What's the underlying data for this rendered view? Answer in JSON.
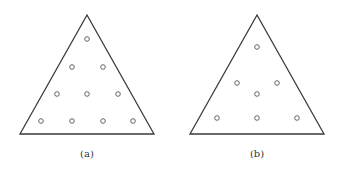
{
  "figure": {
    "panels": [
      {
        "id": "a",
        "caption": "(a)",
        "triangle": [
          [
            87,
            15
          ],
          [
            20,
            134
          ],
          [
            154,
            134
          ]
        ],
        "points": [
          [
            87,
            39
          ],
          [
            72,
            67
          ],
          [
            103,
            67
          ],
          [
            57,
            94
          ],
          [
            87,
            94
          ],
          [
            118,
            94
          ],
          [
            41,
            121
          ],
          [
            72,
            121
          ],
          [
            103,
            121
          ],
          [
            133,
            121
          ]
        ],
        "caption_pos": [
          87,
          157
        ]
      },
      {
        "id": "b",
        "caption": "(b)",
        "triangle": [
          [
            257,
            15
          ],
          [
            190,
            134
          ],
          [
            324,
            134
          ]
        ],
        "points": [
          [
            257,
            47
          ],
          [
            237,
            83
          ],
          [
            277,
            83
          ],
          [
            257,
            94
          ],
          [
            217,
            118
          ],
          [
            257,
            118
          ],
          [
            297,
            118
          ]
        ],
        "caption_pos": [
          257,
          157
        ]
      }
    ],
    "colors": {
      "stroke": "#3a3a3a",
      "point_stroke": "#555555",
      "background": "#ffffff"
    }
  }
}
